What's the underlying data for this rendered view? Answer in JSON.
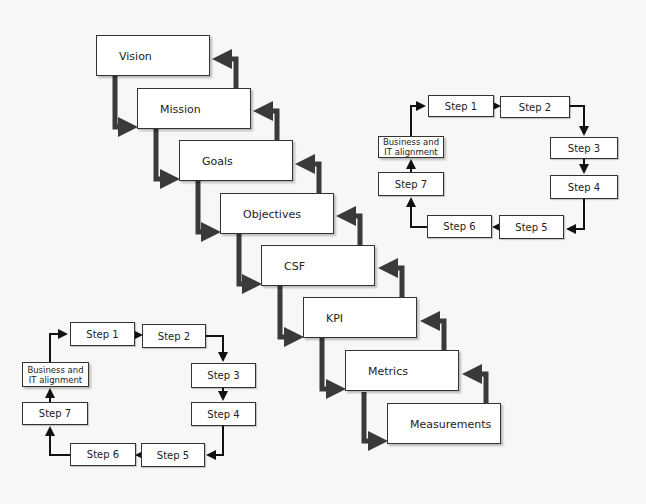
{
  "hierarchy": {
    "levels": [
      {
        "label": "Vision",
        "x": 96,
        "y": 35
      },
      {
        "label": "Mission",
        "x": 137,
        "y": 88
      },
      {
        "label": "Goals",
        "x": 179,
        "y": 140
      },
      {
        "label": "Objectives",
        "x": 220,
        "y": 193
      },
      {
        "label": "CSF",
        "x": 261,
        "y": 245
      },
      {
        "label": "KPI",
        "x": 303,
        "y": 297
      },
      {
        "label": "Metrics",
        "x": 345,
        "y": 350
      },
      {
        "label": "Measurements",
        "x": 387,
        "y": 403
      }
    ],
    "arrow_color": "#3a3a3a"
  },
  "cycle_top_right": {
    "step1": "Step 1",
    "step2": "Step 2",
    "step3": "Step 3",
    "step4": "Step 4",
    "step5": "Step 5",
    "step6": "Step 6",
    "step7": "Step 7",
    "alignment": "Business and IT alignment"
  },
  "cycle_bottom_left": {
    "step1": "Step 1",
    "step2": "Step 2",
    "step3": "Step 3",
    "step4": "Step 4",
    "step5": "Step 5",
    "step6": "Step 6",
    "step7": "Step 7",
    "alignment": "Business and IT alignment"
  }
}
